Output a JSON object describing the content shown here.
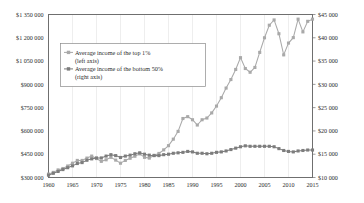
{
  "chart_data": {
    "type": "line",
    "title": "",
    "xlabel": "",
    "ylabel": "",
    "grid": "vertical-only",
    "legend_position": "upper-left-inside",
    "x_ticks": [
      "1960",
      "1965",
      "1970",
      "1975",
      "1980",
      "1985",
      "1990",
      "1995",
      "2000",
      "2005",
      "2010",
      "2015"
    ],
    "xlim": [
      1960,
      2015
    ],
    "left_axis": {
      "label": "",
      "ylim": [
        300000,
        1350000
      ],
      "tick_labels": [
        "$300 000",
        "$450 000",
        "$600 000",
        "$750 000",
        "$900 000",
        "$1 050 000",
        "$1 200 000",
        "$1 350 000"
      ],
      "tick_values": [
        300000,
        450000,
        600000,
        750000,
        900000,
        1050000,
        1200000,
        1350000
      ],
      "currency_prefix": "$",
      "thousands_separator": " "
    },
    "right_axis": {
      "label": "",
      "ylim": [
        10000,
        45000
      ],
      "tick_labels": [
        "$10 000",
        "$15 000",
        "$20 000",
        "$25 000",
        "$30 000",
        "$35 000",
        "$40 000",
        "$45 000"
      ],
      "tick_values": [
        10000,
        15000,
        20000,
        25000,
        30000,
        35000,
        40000,
        45000
      ],
      "currency_prefix": "$",
      "thousands_separator": " "
    },
    "x": [
      1960,
      1961,
      1962,
      1963,
      1964,
      1965,
      1966,
      1967,
      1968,
      1969,
      1970,
      1971,
      1972,
      1973,
      1974,
      1975,
      1976,
      1977,
      1978,
      1979,
      1980,
      1981,
      1982,
      1983,
      1984,
      1985,
      1986,
      1987,
      1988,
      1989,
      1990,
      1991,
      1992,
      1993,
      1994,
      1995,
      1996,
      1997,
      1998,
      1999,
      2000,
      2001,
      2002,
      2003,
      2004,
      2005,
      2006,
      2007,
      2008,
      2009,
      2010,
      2011,
      2012,
      2013,
      2014,
      2015
    ],
    "series": [
      {
        "name": "Average income of the top 1%",
        "axis": "left",
        "legend_label": "Average income of the top 1%",
        "legend_sublabel": "(left axis)",
        "color": "#a9a9a9",
        "marker": "square",
        "values": [
          322000,
          333000,
          349000,
          358000,
          374000,
          392000,
          410000,
          410000,
          425000,
          438000,
          422000,
          404000,
          414000,
          430000,
          412000,
          392000,
          410000,
          424000,
          437000,
          452000,
          430000,
          425000,
          443000,
          455000,
          478000,
          505000,
          547000,
          597000,
          680000,
          692000,
          672000,
          638000,
          672000,
          683000,
          716000,
          760000,
          814000,
          876000,
          931000,
          996000,
          1072000,
          1002000,
          978000,
          1009000,
          1106000,
          1200000,
          1281000,
          1315000,
          1226000,
          1090000,
          1166000,
          1201000,
          1320000,
          1238000,
          1306000,
          1320000
        ]
      },
      {
        "name": "Average income of the bottom 50%",
        "axis": "right",
        "legend_label": "Average income of the bottom 50%",
        "legend_sublabel": "(right axis)",
        "color": "#7d7d7d",
        "marker": "square",
        "values": [
          10500,
          10900,
          11300,
          11700,
          12100,
          12500,
          13000,
          13200,
          13700,
          14000,
          14200,
          14200,
          14600,
          14900,
          14700,
          14300,
          14600,
          14800,
          15100,
          15300,
          15000,
          14800,
          14700,
          14700,
          14900,
          15000,
          15200,
          15300,
          15400,
          15600,
          15500,
          15200,
          15200,
          15100,
          15200,
          15400,
          15500,
          15700,
          16000,
          16300,
          16600,
          16800,
          16700,
          16700,
          16700,
          16700,
          16700,
          16600,
          16200,
          15800,
          15600,
          15500,
          15700,
          15800,
          15900,
          15900
        ]
      }
    ]
  }
}
